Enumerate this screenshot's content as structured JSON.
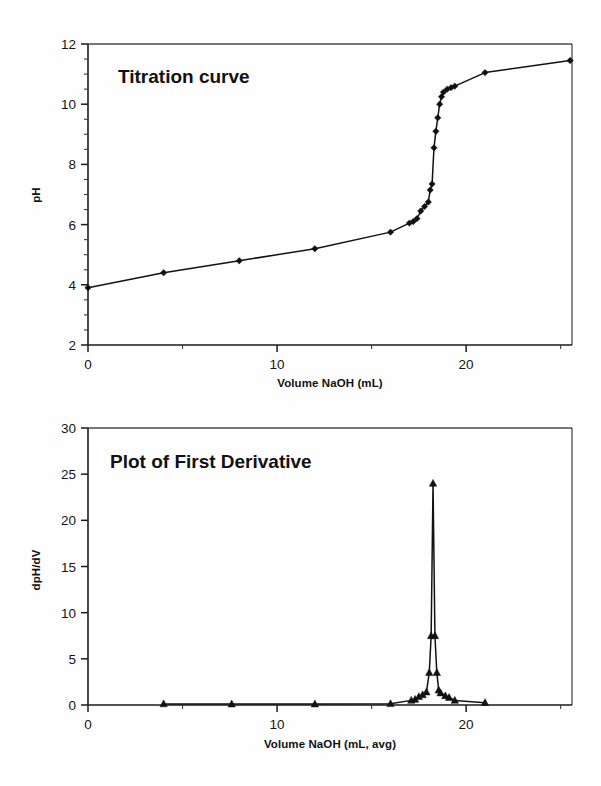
{
  "page": {
    "background_color": "#fefefe",
    "series_color": "#121212"
  },
  "charts": [
    {
      "id": "titration-curve",
      "title": "Titration curve",
      "xlabel": "Volume NaOH  (mL)",
      "ylabel": "pH",
      "xticks": [
        "0",
        "10",
        "20"
      ],
      "yticks": [
        "2",
        "4",
        "6",
        "8",
        "10",
        "12"
      ]
    },
    {
      "id": "first-derivative",
      "title": "Plot of First Derivative",
      "xlabel": "Volume NaOH  (mL, avg)",
      "ylabel": "dpH/dV",
      "xticks": [
        "0",
        "10",
        "20"
      ],
      "yticks": [
        "0",
        "5",
        "10",
        "15",
        "20",
        "25",
        "30"
      ]
    }
  ],
  "chart_data": [
    {
      "type": "line",
      "id": "titration-curve",
      "title": "Titration curve",
      "xlabel": "Volume NaOH  (mL)",
      "ylabel": "pH",
      "xlim": [
        0,
        25.6
      ],
      "ylim": [
        2,
        12
      ],
      "xticks": [
        0,
        10,
        20
      ],
      "xtick_minor_step": 5,
      "yticks": [
        2,
        4,
        6,
        8,
        10,
        12
      ],
      "ytick_minor_step": 0.5,
      "grid": false,
      "legend": "none",
      "marker": "diamond",
      "series": [
        {
          "name": "pH vs Volume NaOH",
          "x": [
            0.0,
            4.0,
            8.0,
            12.0,
            16.0,
            17.0,
            17.2,
            17.4,
            17.6,
            17.8,
            18.0,
            18.1,
            18.2,
            18.3,
            18.4,
            18.5,
            18.6,
            18.7,
            18.8,
            19.0,
            19.2,
            19.4,
            21.0,
            25.5
          ],
          "y": [
            3.9,
            4.4,
            4.8,
            5.2,
            5.75,
            6.05,
            6.1,
            6.2,
            6.45,
            6.6,
            6.75,
            7.15,
            7.35,
            8.55,
            9.1,
            9.55,
            10.0,
            10.25,
            10.4,
            10.5,
            10.55,
            10.6,
            11.05,
            11.45
          ]
        }
      ]
    },
    {
      "type": "line",
      "id": "first-derivative",
      "title": "Plot of First Derivative",
      "xlabel": "Volume NaOH  (mL, avg)",
      "ylabel": "dpH/dV",
      "xlim": [
        0,
        25.6
      ],
      "ylim": [
        0,
        30
      ],
      "xticks": [
        0,
        10,
        20
      ],
      "xtick_minor_step": 5,
      "yticks": [
        0,
        5,
        10,
        15,
        20,
        25,
        30
      ],
      "grid": false,
      "legend": "none",
      "marker": "triangle",
      "series": [
        {
          "name": "dpH/dV vs Volume NaOH (avg)",
          "x": [
            4.0,
            7.6,
            12.0,
            16.0,
            17.1,
            17.3,
            17.5,
            17.7,
            17.9,
            18.05,
            18.15,
            18.25,
            18.35,
            18.45,
            18.55,
            18.65,
            18.9,
            19.1,
            19.4,
            21.0
          ],
          "y": [
            0.12,
            0.1,
            0.1,
            0.14,
            0.5,
            0.6,
            0.9,
            1.1,
            1.4,
            3.5,
            7.5,
            24.0,
            7.5,
            3.5,
            1.6,
            1.3,
            1.0,
            0.8,
            0.5,
            0.25
          ]
        }
      ]
    }
  ]
}
